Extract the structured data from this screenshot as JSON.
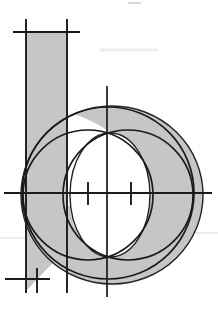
{
  "figure": {
    "letter": "b",
    "background_color": "#ffffff",
    "letterform_fill_color": "#c6c6c6",
    "construction_line_color": "#1b1b1b",
    "letterform_outline_color": "#232323",
    "artifact_color": "#e9e7e2"
  },
  "geometry": {
    "canvas": {
      "width": 218,
      "height": 311,
      "viewBox": "0 0 218 311"
    },
    "shapes": [
      {
        "type": "line",
        "name": "artifact-top-mark",
        "x1": 128,
        "y1": 3,
        "x2": 141,
        "y2": 3,
        "stroke": "#dbd9d4",
        "width": 2
      },
      {
        "type": "line",
        "name": "artifact-top-smudge",
        "x1": 100,
        "y1": 50,
        "x2": 158,
        "y2": 50,
        "stroke": "#efede9",
        "width": 3
      },
      {
        "type": "line",
        "name": "artifact-right-line",
        "x1": 138,
        "y1": 233,
        "x2": 218,
        "y2": 233,
        "stroke": "#e7e5e0",
        "width": 1.6
      },
      {
        "type": "line",
        "name": "artifact-left-line",
        "x1": 0,
        "y1": 238,
        "x2": 46,
        "y2": 238,
        "stroke": "#eceae6",
        "width": 1.6
      },
      {
        "type": "path",
        "name": "letter-stem-fill",
        "d": "M 26 32 L 67 32 L 67 248 L 26 291 Z",
        "fill": "#c6c6c6"
      },
      {
        "type": "ellipse",
        "name": "letter-bowl-fill",
        "cx": 112,
        "cy": 195,
        "rx": 91,
        "ry": 89,
        "fill": "#c6c6c6"
      },
      {
        "type": "path",
        "name": "letter-counter-white",
        "d": "M 67 112 C 88 118 102 126 110 133 C 132 133 150 161 150 195 C 150 229 132 257 110 257 C 88 257 71 231 70 206 L 67 206 Z",
        "fill": "#ffffff"
      },
      {
        "type": "ellipse",
        "name": "bowl-outline",
        "cx": 112,
        "cy": 195,
        "rx": 91,
        "ry": 89,
        "stroke": "#232323",
        "width": 1.4
      },
      {
        "type": "ellipse",
        "name": "counter-outline",
        "cx": 110,
        "cy": 195,
        "rx": 40,
        "ry": 62,
        "stroke": "#232323",
        "width": 1.4
      },
      {
        "type": "circle",
        "name": "construction-circle-outer",
        "cx": 108,
        "cy": 193,
        "r": 86,
        "stroke": "#1b1b1b",
        "width": 1.7
      },
      {
        "type": "circle",
        "name": "construction-circle-left",
        "cx": 88,
        "cy": 195,
        "r": 65,
        "stroke": "#1b1b1b",
        "width": 1.7
      },
      {
        "type": "circle",
        "name": "construction-circle-right",
        "cx": 128,
        "cy": 195,
        "r": 65,
        "stroke": "#1b1b1b",
        "width": 1.7
      },
      {
        "type": "line",
        "name": "ascender-guide-line",
        "x1": 13,
        "y1": 32,
        "x2": 80,
        "y2": 32,
        "stroke": "#1b1b1b",
        "width": 1.9
      },
      {
        "type": "line",
        "name": "stem-left-guide-line",
        "x1": 26,
        "y1": 19,
        "x2": 26,
        "y2": 293,
        "stroke": "#1b1b1b",
        "width": 1.9
      },
      {
        "type": "line",
        "name": "stem-right-guide-line",
        "x1": 67,
        "y1": 19,
        "x2": 67,
        "y2": 293,
        "stroke": "#1b1b1b",
        "width": 1.9
      },
      {
        "type": "line",
        "name": "center-vertical-line",
        "x1": 107,
        "y1": 86,
        "x2": 107,
        "y2": 297,
        "stroke": "#1b1b1b",
        "width": 1.7
      },
      {
        "type": "line",
        "name": "midline-horizontal",
        "x1": 4,
        "y1": 193,
        "x2": 212,
        "y2": 193,
        "stroke": "#1b1b1b",
        "width": 1.9
      },
      {
        "type": "line",
        "name": "baseline-short-line",
        "x1": 5,
        "y1": 279,
        "x2": 50,
        "y2": 279,
        "stroke": "#1b1b1b",
        "width": 1.9
      },
      {
        "type": "line",
        "name": "baseline-tick",
        "x1": 37,
        "y1": 268,
        "x2": 37,
        "y2": 293,
        "stroke": "#1b1b1b",
        "width": 1.9
      },
      {
        "type": "line",
        "name": "center-tick-left",
        "x1": 88,
        "y1": 182,
        "x2": 88,
        "y2": 205,
        "stroke": "#1b1b1b",
        "width": 1.9
      },
      {
        "type": "line",
        "name": "center-tick-right",
        "x1": 131,
        "y1": 182,
        "x2": 131,
        "y2": 205,
        "stroke": "#1b1b1b",
        "width": 1.9
      }
    ]
  }
}
